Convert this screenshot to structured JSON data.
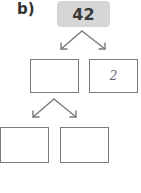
{
  "label": "b)",
  "root": {
    "value": "42"
  },
  "level1": [
    {
      "value": ""
    },
    {
      "value": "2"
    }
  ],
  "level2": [
    {
      "value": ""
    },
    {
      "value": ""
    }
  ],
  "colors": {
    "root_fill": "#d6d6d6",
    "box_border": "#7a7a7a",
    "arrow": "#7a7a7a"
  }
}
